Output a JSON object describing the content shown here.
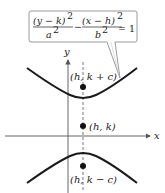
{
  "equation": {
    "numerator_left": "(y − k)",
    "exp_left": "2",
    "denominator_left": "a",
    "den_exp_left": "2",
    "minus": "−",
    "numerator_right": "(x − h)",
    "exp_right": "2",
    "denominator_right": "b",
    "den_exp_right": "2",
    "equals": "= 1"
  },
  "axes": {
    "x_label": "x",
    "y_label": "y"
  },
  "points": [
    {
      "name": "focus-upper",
      "label": "(h, k + c)"
    },
    {
      "name": "center",
      "label": "(h, k)"
    },
    {
      "name": "focus-lower",
      "label": "(h, k − c)"
    }
  ],
  "colors": {
    "curve": "#1a1a1a",
    "axis": "#555555",
    "callout_border": "#9a9a9a"
  }
}
